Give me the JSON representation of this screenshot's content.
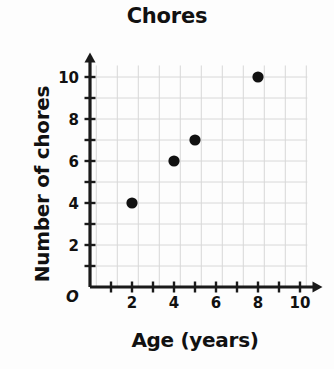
{
  "chart_data": {
    "type": "scatter",
    "title": "Chores",
    "xlabel": "Age (years)",
    "ylabel": "Number of chores",
    "origin_label": "O",
    "xlim": [
      0,
      10.5
    ],
    "ylim": [
      0,
      10.6
    ],
    "grid": true,
    "legend": "none",
    "x_tick_values": [
      1,
      2,
      3,
      4,
      5,
      6,
      7,
      8,
      9,
      10
    ],
    "y_tick_values": [
      1,
      2,
      3,
      4,
      5,
      6,
      7,
      8,
      9,
      10
    ],
    "x_tick_labels": [
      "2",
      "4",
      "6",
      "8",
      "10"
    ],
    "x_tick_label_values": [
      2,
      4,
      6,
      8,
      10
    ],
    "y_tick_labels": [
      "2",
      "4",
      "6",
      "8",
      "10"
    ],
    "y_tick_label_values": [
      2,
      4,
      6,
      8,
      10
    ],
    "points": [
      {
        "x": 2,
        "y": 4
      },
      {
        "x": 4,
        "y": 6
      },
      {
        "x": 5,
        "y": 7
      },
      {
        "x": 8,
        "y": 10
      }
    ],
    "colors": {
      "point": "#111111",
      "axis": "#1a1a1a",
      "grid": "#d8d8d8",
      "background": "#fdfdfd",
      "text": "#111111"
    }
  }
}
